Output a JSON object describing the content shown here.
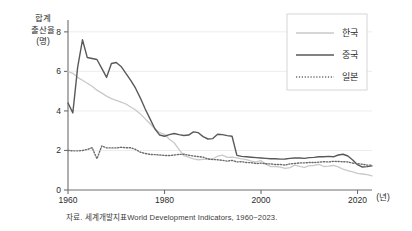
{
  "figure": {
    "y_axis_title_lines": [
      "합계",
      "출산율",
      "(명)"
    ],
    "x_unit_label": "(년)",
    "caption": "자료. 세계개발지표World Development Indicators, 1960~2023."
  },
  "colors": {
    "korea": "#c9c9c9",
    "china": "#595959",
    "japan": "#6b6b6b",
    "axis": "#6e6e6e",
    "grid": "#ededed",
    "legend_border": "#d5d5d5",
    "text": "#2b2b2b"
  },
  "chart_data": {
    "type": "line",
    "title": "",
    "xlabel": "(년)",
    "ylabel": "합계 출산율 (명)",
    "xlim": [
      1960,
      2023
    ],
    "ylim": [
      0,
      8.6
    ],
    "xticks": [
      1960,
      1980,
      2000,
      2020
    ],
    "yticks": [
      0,
      2,
      4,
      6,
      8
    ],
    "grid": true,
    "legend_position": "top-right",
    "x": [
      1960,
      1961,
      1962,
      1963,
      1964,
      1965,
      1966,
      1967,
      1968,
      1969,
      1970,
      1971,
      1972,
      1973,
      1974,
      1975,
      1976,
      1977,
      1978,
      1979,
      1980,
      1981,
      1982,
      1983,
      1984,
      1985,
      1986,
      1987,
      1988,
      1989,
      1990,
      1991,
      1992,
      1993,
      1994,
      1995,
      1996,
      1997,
      1998,
      1999,
      2000,
      2001,
      2002,
      2003,
      2004,
      2005,
      2006,
      2007,
      2008,
      2009,
      2010,
      2011,
      2012,
      2013,
      2014,
      2015,
      2016,
      2017,
      2018,
      2019,
      2020,
      2021,
      2022,
      2023
    ],
    "series": [
      {
        "name": "한국",
        "style": "solid-light",
        "values": [
          6.0,
          5.9,
          5.7,
          5.55,
          5.4,
          5.25,
          5.05,
          4.9,
          4.75,
          4.62,
          4.53,
          4.45,
          4.35,
          4.2,
          4.05,
          3.85,
          3.6,
          3.35,
          3.1,
          2.9,
          2.82,
          2.57,
          2.39,
          2.06,
          1.74,
          1.66,
          1.58,
          1.53,
          1.55,
          1.56,
          1.57,
          1.71,
          1.76,
          1.65,
          1.66,
          1.63,
          1.57,
          1.54,
          1.46,
          1.42,
          1.48,
          1.31,
          1.18,
          1.19,
          1.16,
          1.09,
          1.13,
          1.26,
          1.19,
          1.15,
          1.23,
          1.24,
          1.3,
          1.19,
          1.21,
          1.24,
          1.17,
          1.05,
          0.98,
          0.92,
          0.84,
          0.81,
          0.78,
          0.72
        ]
      },
      {
        "name": "중국",
        "style": "solid-dark",
        "values": [
          4.4,
          3.9,
          6.2,
          7.6,
          6.7,
          6.65,
          6.6,
          6.15,
          5.7,
          6.4,
          6.45,
          6.25,
          5.9,
          5.55,
          5.15,
          4.65,
          4.1,
          3.6,
          3.1,
          2.78,
          2.72,
          2.8,
          2.86,
          2.8,
          2.76,
          2.78,
          2.94,
          2.9,
          2.7,
          2.58,
          2.6,
          2.82,
          2.8,
          2.75,
          2.72,
          1.75,
          1.7,
          1.68,
          1.66,
          1.64,
          1.62,
          1.6,
          1.58,
          1.58,
          1.56,
          1.57,
          1.6,
          1.62,
          1.62,
          1.6,
          1.64,
          1.65,
          1.68,
          1.68,
          1.7,
          1.68,
          1.77,
          1.81,
          1.72,
          1.52,
          1.28,
          1.16,
          1.18,
          1.22
        ]
      },
      {
        "name": "일본",
        "style": "dotted",
        "values": [
          2.0,
          1.98,
          1.98,
          2.0,
          2.05,
          2.14,
          1.58,
          2.23,
          2.13,
          2.13,
          2.13,
          2.16,
          2.14,
          2.14,
          2.05,
          1.91,
          1.85,
          1.8,
          1.79,
          1.77,
          1.75,
          1.74,
          1.77,
          1.8,
          1.81,
          1.76,
          1.72,
          1.69,
          1.66,
          1.57,
          1.54,
          1.53,
          1.5,
          1.46,
          1.5,
          1.42,
          1.43,
          1.39,
          1.38,
          1.34,
          1.36,
          1.33,
          1.32,
          1.29,
          1.29,
          1.26,
          1.32,
          1.34,
          1.37,
          1.37,
          1.39,
          1.39,
          1.41,
          1.43,
          1.42,
          1.45,
          1.44,
          1.43,
          1.42,
          1.36,
          1.33,
          1.3,
          1.26,
          1.26
        ]
      }
    ]
  },
  "legend": {
    "items": [
      {
        "label": "한국",
        "style": "solid-light"
      },
      {
        "label": "중국",
        "style": "solid-dark"
      },
      {
        "label": "일본",
        "style": "dotted"
      }
    ]
  }
}
